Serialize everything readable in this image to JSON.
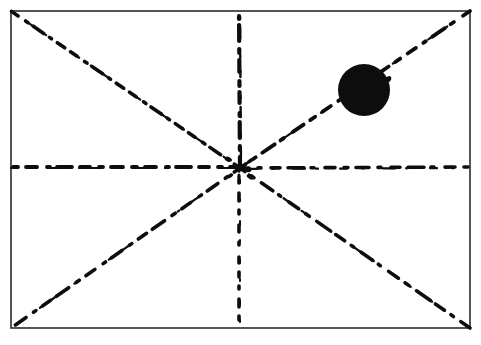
{
  "document": {
    "title": "Radiating Dashed Lines Diagram",
    "medium": "scanned line drawing",
    "background_color": "#ffffff",
    "ink_color": "#0d0d0d",
    "canvas": {
      "width": 481,
      "height": 345
    }
  },
  "frame": {
    "name": "rectangular border",
    "x": 11,
    "y": 11,
    "width": 459,
    "height": 317,
    "stroke_color": "#2b2b2b",
    "stroke_width": 1.6,
    "fill": "none",
    "style": "solid"
  },
  "center": {
    "label": "convergence point",
    "x": 240,
    "y": 168
  },
  "chart_data": {
    "type": "scatter",
    "subtitle": "Eight hand-drawn dashed rays from a central point inside a rectangular frame",
    "xlabel": "",
    "ylabel": "",
    "xlim": [
      0,
      481
    ],
    "ylim": [
      0,
      345
    ],
    "grid": false,
    "legend": "none",
    "annotations": [
      "Solid black disc in the upper-right quadrant",
      "All eight rays converge at the centre of the frame"
    ],
    "series": [
      {
        "name": "ray-to-top-left-corner",
        "x": [
          240,
          11
        ],
        "y": [
          168,
          11
        ],
        "style": "dash-dot",
        "color": "#0d0d0d"
      },
      {
        "name": "ray-to-top-edge-midpoint",
        "x": [
          240,
          239
        ],
        "y": [
          168,
          11
        ],
        "style": "dashed",
        "color": "#0d0d0d"
      },
      {
        "name": "ray-to-top-right-corner",
        "x": [
          240,
          470
        ],
        "y": [
          168,
          11
        ],
        "style": "dashed",
        "color": "#0d0d0d"
      },
      {
        "name": "ray-to-right-edge-midpoint",
        "x": [
          240,
          470
        ],
        "y": [
          168,
          167
        ],
        "style": "dash-dot",
        "color": "#0d0d0d"
      },
      {
        "name": "ray-to-bottom-right-corner",
        "x": [
          240,
          470
        ],
        "y": [
          168,
          328
        ],
        "style": "dash-dot",
        "color": "#0d0d0d"
      },
      {
        "name": "ray-to-bottom-edge-midpoint",
        "x": [
          239,
          239
        ],
        "y": [
          168,
          328
        ],
        "style": "dotted",
        "color": "#0d0d0d"
      },
      {
        "name": "ray-to-bottom-left-corner",
        "x": [
          240,
          11
        ],
        "y": [
          168,
          328
        ],
        "style": "dash-dot",
        "color": "#0d0d0d"
      },
      {
        "name": "ray-to-left-edge-midpoint",
        "x": [
          240,
          11
        ],
        "y": [
          167,
          167
        ],
        "style": "dashed",
        "color": "#0d0d0d"
      }
    ],
    "markers": [
      {
        "name": "filled-circle",
        "shape": "circle",
        "filled": true,
        "cx": 364,
        "cy": 90,
        "r": 26,
        "color": "#0d0d0d",
        "quadrant": "upper-right"
      }
    ]
  }
}
